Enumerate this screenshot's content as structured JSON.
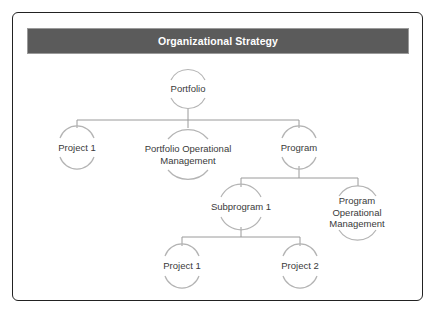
{
  "title": "Organizational Strategy",
  "colors": {
    "header_bg": "#5b5b5b",
    "header_text": "#ffffff",
    "arc": "#b4b4b4",
    "connector": "#9a9a9a",
    "label": "#3a3a3a",
    "frame_border": "#222222"
  },
  "nodes": {
    "portfolio": {
      "label": "Portfolio"
    },
    "project_1_top": {
      "label": "Project 1"
    },
    "portfolio_ops": {
      "line1": "Portfolio Operational",
      "line2": "Management"
    },
    "program": {
      "label": "Program"
    },
    "subprogram_1": {
      "label": "Subprogram 1"
    },
    "program_ops": {
      "line1": "Program",
      "line2": "Operational",
      "line3": "Management"
    },
    "project_1_bottom": {
      "label": "Project 1"
    },
    "project_2": {
      "label": "Project 2"
    }
  },
  "hierarchy": [
    {
      "parent": "Organizational Strategy",
      "children": [
        "Portfolio"
      ]
    },
    {
      "parent": "Portfolio",
      "children": [
        "Project 1",
        "Portfolio Operational Management",
        "Program"
      ]
    },
    {
      "parent": "Program",
      "children": [
        "Subprogram 1",
        "Program Operational Management"
      ]
    },
    {
      "parent": "Subprogram 1",
      "children": [
        "Project 1",
        "Project 2"
      ]
    }
  ]
}
